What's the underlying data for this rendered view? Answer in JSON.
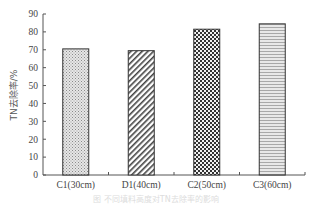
{
  "chart_data": {
    "type": "bar",
    "title": "",
    "xlabel": "",
    "ylabel": "TN去除率/%",
    "categories": [
      "C1(30cm)",
      "D1(40cm)",
      "C2(50cm)",
      "C3(60cm)"
    ],
    "values": [
      70.5,
      69.5,
      81.5,
      84.5
    ],
    "ylim": [
      0,
      90
    ],
    "yticks": [
      0,
      10,
      20,
      30,
      40,
      50,
      60,
      70,
      80,
      90
    ],
    "grid": false,
    "legend": null,
    "bar_patterns": [
      "dots",
      "diagonal-hatch",
      "checkerboard",
      "horizontal-lines"
    ],
    "caption": "图 不同填料高度对TN去除率的影响"
  }
}
